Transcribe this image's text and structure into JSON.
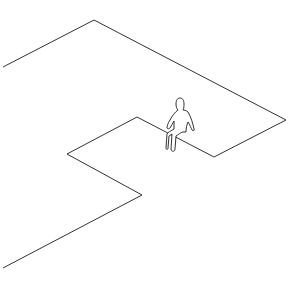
{
  "diagram": {
    "type": "isometric-line-drawing",
    "description": "Isometric outline of a stepped platform/ledge with a seated human figure on the edge",
    "stroke_color": "#333333",
    "background": "#ffffff",
    "outline_points": [
      [
        3,
        67
      ],
      [
        94,
        20
      ],
      [
        286,
        120
      ],
      [
        214,
        157
      ],
      [
        137,
        117
      ],
      [
        67,
        154
      ],
      [
        142,
        195
      ],
      [
        3,
        268
      ]
    ],
    "figure": {
      "label": "seated-person",
      "position": [
        180,
        125
      ]
    }
  }
}
